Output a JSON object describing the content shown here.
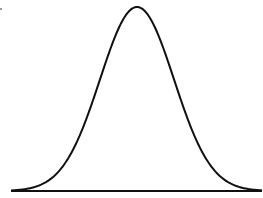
{
  "figure": {
    "type": "normal-distribution-curve",
    "stroke_color": "#111111",
    "background": "#ffffff",
    "curve": {
      "peak_x": 137,
      "peak_y": 7,
      "baseline_y": 191,
      "sigma_px": 37,
      "x_start": 11,
      "x_end": 262
    },
    "baseline": {
      "x1": 11,
      "x2": 262,
      "y": 191
    }
  }
}
